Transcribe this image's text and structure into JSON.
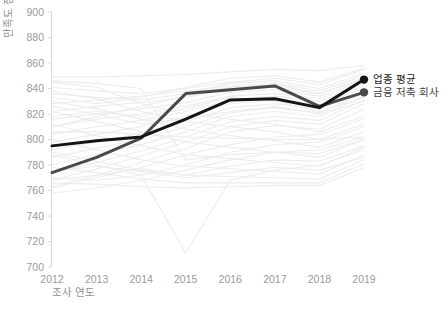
{
  "chart_data": {
    "type": "line",
    "title": "",
    "xlabel": "조사 연도",
    "ylabel": "만족도 점수",
    "x": [
      2012,
      2013,
      2014,
      2015,
      2016,
      2017,
      2018,
      2019
    ],
    "categories": [
      "2012",
      "2013",
      "2014",
      "2015",
      "2016",
      "2017",
      "2018",
      "2019"
    ],
    "ylim": [
      700,
      900
    ],
    "yticks": [
      700,
      720,
      740,
      760,
      780,
      800,
      820,
      840,
      860,
      880,
      900
    ],
    "ytick_labels": [
      "700",
      "720",
      "740",
      "760",
      "780",
      "800",
      "820",
      "840",
      "860",
      "880",
      "900"
    ],
    "grid": false,
    "legend_position": "right-end-of-line",
    "series": [
      {
        "name": "업종 평균",
        "color": "#141414",
        "highlight": true,
        "marker": "circle",
        "values": [
          795,
          799,
          802,
          816,
          831,
          832,
          825,
          847
        ]
      },
      {
        "name": "금융 저축 회사",
        "color": "#4a4a4a",
        "highlight": true,
        "marker": "circle",
        "values": [
          774,
          786,
          801,
          836,
          839,
          842,
          826,
          837
        ]
      },
      {
        "name": "background-company-01",
        "color": "#ececec",
        "highlight": false,
        "values": [
          849,
          849,
          850,
          851,
          853,
          855,
          854,
          858
        ]
      },
      {
        "name": "background-company-02",
        "color": "#ececec",
        "highlight": false,
        "values": [
          841,
          838,
          836,
          840,
          845,
          848,
          843,
          855
        ]
      },
      {
        "name": "background-company-03",
        "color": "#ececec",
        "highlight": false,
        "values": [
          836,
          833,
          831,
          836,
          844,
          846,
          840,
          852
        ]
      },
      {
        "name": "background-company-04",
        "color": "#ececec",
        "highlight": false,
        "values": [
          828,
          831,
          834,
          838,
          842,
          844,
          838,
          850
        ]
      },
      {
        "name": "background-company-05",
        "color": "#ececec",
        "highlight": false,
        "values": [
          822,
          826,
          829,
          833,
          840,
          841,
          836,
          848
        ]
      },
      {
        "name": "background-company-06",
        "color": "#ececec",
        "highlight": false,
        "values": [
          816,
          820,
          824,
          829,
          837,
          839,
          834,
          846
        ]
      },
      {
        "name": "background-company-07",
        "color": "#ececec",
        "highlight": false,
        "values": [
          810,
          816,
          820,
          826,
          834,
          836,
          832,
          844
        ]
      },
      {
        "name": "background-company-08",
        "color": "#ececec",
        "highlight": false,
        "values": [
          804,
          810,
          815,
          822,
          831,
          834,
          830,
          842
        ]
      },
      {
        "name": "background-company-09",
        "color": "#ececec",
        "highlight": false,
        "values": [
          798,
          804,
          810,
          818,
          828,
          831,
          827,
          840
        ]
      },
      {
        "name": "background-company-10",
        "color": "#ececec",
        "highlight": false,
        "values": [
          792,
          798,
          805,
          814,
          825,
          828,
          824,
          838
        ]
      },
      {
        "name": "background-company-11",
        "color": "#ececec",
        "highlight": false,
        "values": [
          786,
          793,
          800,
          810,
          821,
          825,
          821,
          836
        ]
      },
      {
        "name": "background-company-12",
        "color": "#ececec",
        "highlight": false,
        "values": [
          780,
          788,
          796,
          806,
          818,
          822,
          818,
          834
        ]
      },
      {
        "name": "background-company-13",
        "color": "#ececec",
        "highlight": false,
        "values": [
          774,
          782,
          791,
          802,
          814,
          818,
          815,
          831
        ]
      },
      {
        "name": "background-company-14",
        "color": "#ececec",
        "highlight": false,
        "values": [
          768,
          777,
          787,
          798,
          810,
          815,
          812,
          828
        ]
      },
      {
        "name": "background-company-15",
        "color": "#ececec",
        "highlight": false,
        "values": [
          763,
          772,
          782,
          793,
          806,
          811,
          808,
          824
        ]
      },
      {
        "name": "background-company-16",
        "color": "#ececec",
        "highlight": false,
        "values": [
          845,
          841,
          828,
          820,
          816,
          812,
          806,
          818
        ]
      },
      {
        "name": "background-company-17",
        "color": "#ececec",
        "highlight": false,
        "values": [
          838,
          832,
          822,
          814,
          810,
          806,
          800,
          812
        ]
      },
      {
        "name": "background-company-18",
        "color": "#ececec",
        "highlight": false,
        "values": [
          830,
          824,
          816,
          808,
          803,
          799,
          794,
          806
        ]
      },
      {
        "name": "background-company-19",
        "color": "#ececec",
        "highlight": false,
        "values": [
          822,
          814,
          806,
          798,
          794,
          790,
          786,
          800
        ]
      },
      {
        "name": "background-company-20",
        "color": "#ececec",
        "highlight": false,
        "values": [
          812,
          803,
          795,
          788,
          785,
          782,
          779,
          794
        ]
      },
      {
        "name": "background-company-21",
        "color": "#ececec",
        "highlight": false,
        "values": [
          800,
          792,
          784,
          779,
          777,
          775,
          773,
          788
        ]
      },
      {
        "name": "background-company-22",
        "color": "#ececec",
        "highlight": false,
        "values": [
          790,
          783,
          776,
          772,
          771,
          770,
          769,
          784
        ]
      },
      {
        "name": "background-company-23",
        "color": "#ececec",
        "highlight": false,
        "values": [
          778,
          774,
          769,
          766,
          766,
          766,
          766,
          781
        ]
      },
      {
        "name": "background-company-24",
        "color": "#ececec",
        "highlight": false,
        "values": [
          766,
          765,
          763,
          762,
          763,
          764,
          764,
          778
        ]
      },
      {
        "name": "background-company-25",
        "color": "#ececec",
        "highlight": false,
        "values": [
          806,
          806,
          804,
          802,
          801,
          800,
          800,
          802
        ]
      },
      {
        "name": "background-company-26",
        "color": "#ececec",
        "highlight": false,
        "values": [
          758,
          762,
          768,
          776,
          784,
          790,
          792,
          802
        ]
      },
      {
        "name": "background-company-27",
        "color": "#ececec",
        "highlight": false,
        "values": [
          770,
          768,
          772,
          780,
          790,
          796,
          798,
          810
        ]
      },
      {
        "name": "background-company-28",
        "color": "#ececec",
        "highlight": false,
        "values": [
          762,
          770,
          778,
          788,
          796,
          802,
          804,
          816
        ]
      },
      {
        "name": "background-company-29",
        "color": "#ececec",
        "highlight": false,
        "values": [
          846,
          844,
          840,
          784,
          788,
          790,
          789,
          800
        ]
      },
      {
        "name": "background-company-30",
        "color": "#ececec",
        "highlight": false,
        "values": [
          788,
          780,
          772,
          711,
          768,
          776,
          780,
          792
        ]
      },
      {
        "name": "background-company-31",
        "color": "#ececec",
        "highlight": false,
        "values": [
          775,
          779,
          775,
          770,
          774,
          778,
          776,
          786
        ]
      },
      {
        "name": "background-company-32",
        "color": "#ececec",
        "highlight": false,
        "values": [
          768,
          772,
          777,
          772,
          779,
          784,
          783,
          795
        ]
      },
      {
        "name": "background-company-33",
        "color": "#ececec",
        "highlight": false,
        "values": [
          818,
          822,
          818,
          824,
          833,
          830,
          822,
          833
        ]
      },
      {
        "name": "background-company-34",
        "color": "#ececec",
        "highlight": false,
        "values": [
          833,
          828,
          833,
          841,
          848,
          850,
          845,
          856
        ]
      },
      {
        "name": "background-company-35",
        "color": "#ececec",
        "highlight": false,
        "values": [
          826,
          820,
          812,
          816,
          822,
          826,
          820,
          830
        ]
      },
      {
        "name": "background-company-36",
        "color": "#ececec",
        "highlight": false,
        "values": [
          810,
          818,
          826,
          834,
          841,
          843,
          836,
          847
        ]
      }
    ]
  },
  "axis": {
    "y_title": "만족도 점수",
    "x_title": "조사 연도"
  },
  "legend": {
    "entries": [
      {
        "label": "업종 평균",
        "color": "#141414"
      },
      {
        "label": "금융 저축 회사",
        "color": "#4a4a4a"
      }
    ]
  }
}
